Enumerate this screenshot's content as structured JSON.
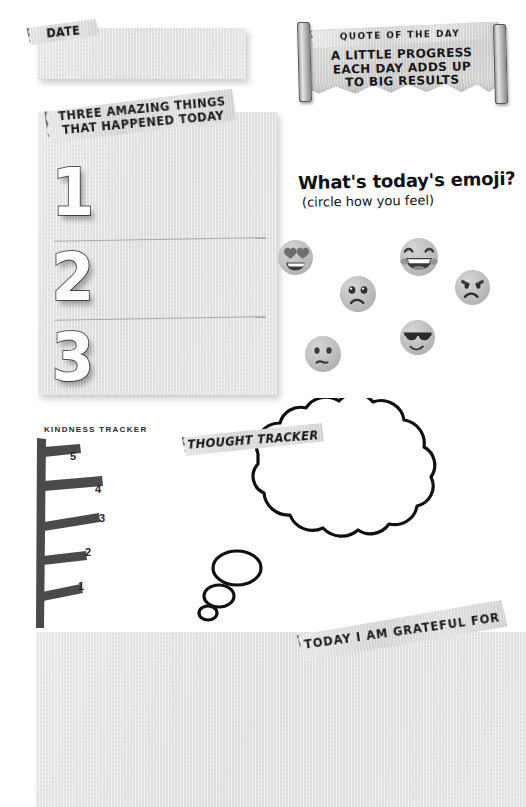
{
  "page": {
    "background_color": "#ffffff",
    "paper_color": "#e2e2e0",
    "ink_color": "#1a1a1c"
  },
  "date_section": {
    "label": "DATE",
    "field_value": "",
    "field_placeholder": ""
  },
  "quote_section": {
    "header_label": "QUOTE OF THE DAY",
    "lines": [
      "A LITTLE PROGRESS",
      "EACH DAY ADDS UP",
      "TO BIG RESULTS"
    ]
  },
  "three_things": {
    "header_line_1": "THREE AMAZING THINGS",
    "header_line_2": "THAT HAPPENED TODAY",
    "items": [
      {
        "number": "1",
        "value": ""
      },
      {
        "number": "2",
        "value": ""
      },
      {
        "number": "3",
        "value": ""
      }
    ]
  },
  "emoji_section": {
    "title": "What's today's emoji?",
    "subtitle": "(circle how you feel)",
    "options": [
      {
        "name": "heart-eyes-emoji",
        "label": "heart eyes",
        "selected": false
      },
      {
        "name": "laughing-emoji",
        "label": "laughing",
        "selected": false
      },
      {
        "name": "sad-emoji",
        "label": "sad",
        "selected": false
      },
      {
        "name": "angry-emoji",
        "label": "angry",
        "selected": false
      },
      {
        "name": "sunglasses-emoji",
        "label": "cool",
        "selected": false
      },
      {
        "name": "frowning-emoji",
        "label": "unsure",
        "selected": false
      }
    ]
  },
  "kindness_tracker": {
    "title": "KINDNESS TRACKER",
    "rungs": [
      "5",
      "4",
      "3",
      "2",
      "1"
    ]
  },
  "thought_tracker": {
    "label": "THOUGHT TRACKER",
    "bubble_value": ""
  },
  "grateful_section": {
    "label": "TODAY I AM GRATEFUL FOR",
    "field_value": ""
  }
}
